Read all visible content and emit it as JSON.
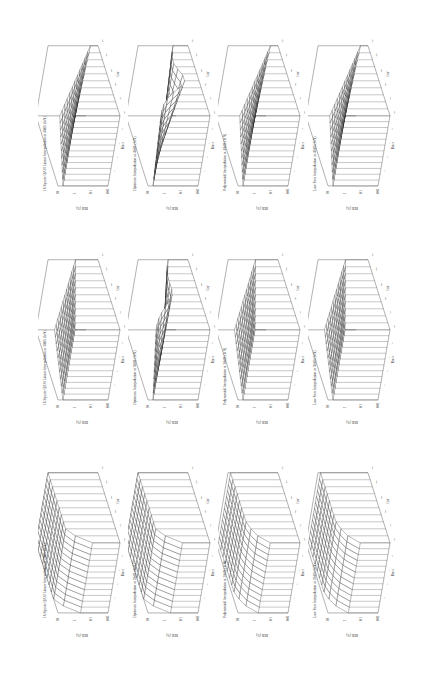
{
  "figure": {
    "orientation": "rotated 90 degrees counter-clockwise",
    "rows_in_landscape": [
      "16 Square QAM Linear Interpolation",
      "Optimum Interpolation",
      "Polynomial Interpolation",
      "Low Pass Interpolation"
    ],
    "columns_in_landscape": [
      "20dB",
      "30dB",
      "40dB"
    ],
    "panels": [
      {
        "title": "16 Square QAM Linear Interpolation at 20dB (InN)",
        "shape": "flat_step"
      },
      {
        "title": "16 Square QAM Linear Interpolation at 30dB (InN)",
        "shape": "slope"
      },
      {
        "title": "16 Square QAM Linear Interpolation at 40dB (InN)",
        "shape": "slope_deep"
      },
      {
        "title": "Optimum Interpolation at 20dB (InN)",
        "shape": "flat_step"
      },
      {
        "title": "Optimum Interpolation at 30dB (InN)",
        "shape": "dip"
      },
      {
        "title": "Optimum Interpolation at 40dB (InN)",
        "shape": "dip_deep"
      },
      {
        "title": "Polynomial Interpolation at 20dB (InN)",
        "shape": "peak"
      },
      {
        "title": "Polynomial Interpolation at 30dB (InN)",
        "shape": "slope"
      },
      {
        "title": "Polynomial Interpolation at 40dB (InN)",
        "shape": "slope_deep"
      },
      {
        "title": "Low Pass Interpolation at 20dB (InN)",
        "shape": "peak"
      },
      {
        "title": "Low Pass Interpolation at 30dB (InN)",
        "shape": "slope"
      },
      {
        "title": "Low Pass Interpolation at 40dB (InN)",
        "shape": "slope_deep"
      }
    ],
    "axes": {
      "z_label": "BER (%)",
      "z_ticks": [
        "10",
        "1",
        "0.1",
        "0.01"
      ],
      "x_label": "Bmax",
      "x_ticks": [
        "1",
        "3",
        "5",
        "7",
        "9",
        "11"
      ],
      "y_label": "Cmf",
      "y_ticks": [
        "20",
        "40",
        "60",
        "80",
        "100",
        "120"
      ]
    }
  },
  "chart_data": {
    "type": "surface",
    "xlabel": "Bmax",
    "ylabel": "Cmf",
    "zlabel": "BER (%)",
    "z_scale": "log",
    "zlim": [
      0.01,
      10
    ],
    "x": [
      1,
      2,
      3,
      4,
      5,
      6,
      7,
      8,
      9,
      10,
      11
    ],
    "y": [
      20,
      40,
      60,
      80,
      100,
      120
    ],
    "series": [
      {
        "name": "Low Pass 20dB",
        "note": "BER ~10% plateau, drop near Bmax 1-2"
      },
      {
        "name": "Low Pass 30dB",
        "note": "gradual descent toward 0.1%"
      },
      {
        "name": "Low Pass 40dB",
        "note": "descent toward 0.01%"
      },
      {
        "name": "Polynomial 20dB",
        "note": "BER ~10% plateau"
      },
      {
        "name": "Polynomial 30dB",
        "note": "descent toward 0.1%"
      },
      {
        "name": "Polynomial 40dB",
        "note": "descent toward 0.01%"
      },
      {
        "name": "Optimum 20dB",
        "note": "plateau with ridge"
      },
      {
        "name": "Optimum 30dB",
        "note": "valley at mid Cmf"
      },
      {
        "name": "Optimum 40dB",
        "note": "deep valley at mid Cmf"
      },
      {
        "name": "16 Square QAM Linear 20dB",
        "note": "flat high BER"
      },
      {
        "name": "16 Square QAM Linear 30dB",
        "note": "linear slope"
      },
      {
        "name": "16 Square QAM Linear 40dB",
        "note": "linear slope deeper"
      }
    ]
  }
}
